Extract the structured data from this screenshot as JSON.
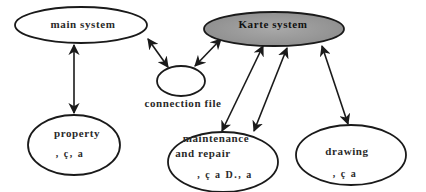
{
  "diagram": {
    "nodes": [
      {
        "id": "main",
        "label": "main system",
        "sublabel": "",
        "fill": "#ffffff"
      },
      {
        "id": "karte",
        "label": "Karte system",
        "sublabel": "",
        "fill": "#9a9a9a"
      },
      {
        "id": "connection",
        "label": "connection file",
        "sublabel": "",
        "fill": "#ffffff"
      },
      {
        "id": "property",
        "label": "property",
        "sublabel": ", ç, a",
        "fill": "#ffffff"
      },
      {
        "id": "maintenance",
        "label_line1": "maintenance",
        "label_line2": "and repair",
        "sublabel": ", ç a D., a",
        "fill": "#ffffff"
      },
      {
        "id": "drawing",
        "label": "drawing",
        "sublabel": ", ç a",
        "fill": "#ffffff"
      }
    ],
    "edges": [
      {
        "from": "main",
        "to": "property",
        "type": "bidirectional"
      },
      {
        "from": "main",
        "to": "connection",
        "type": "bidirectional"
      },
      {
        "from": "karte",
        "to": "connection",
        "type": "bidirectional"
      },
      {
        "from": "karte",
        "to": "maintenance",
        "type": "bidirectional"
      },
      {
        "from": "karte",
        "to": "maintenance",
        "type": "bidirectional"
      },
      {
        "from": "karte",
        "to": "drawing",
        "type": "bidirectional"
      }
    ],
    "colors": {
      "stroke": "#1a1a1a",
      "karte_fill": "#9a9a9a",
      "background": "#ffffff"
    }
  }
}
